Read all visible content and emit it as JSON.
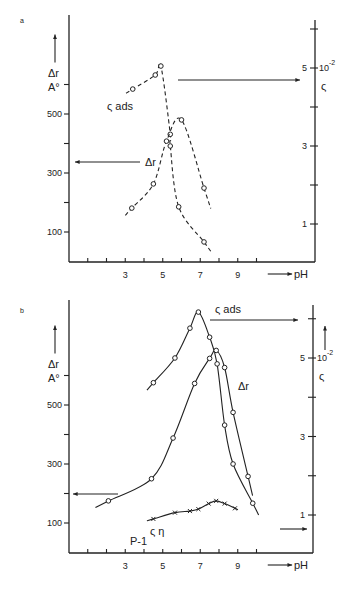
{
  "chart_data": [
    {
      "type": "line",
      "panel_label": "a",
      "xlabel": "pH",
      "ylabel": "Δr A°",
      "ylabel_right": "ς 10⁻²",
      "x_ticks": [
        "3",
        "5",
        "7",
        "9"
      ],
      "y_ticks_left": [
        "100",
        "300",
        "500"
      ],
      "y_ticks_right": [
        "1",
        "3",
        "5"
      ],
      "xlim": [
        0,
        13
      ],
      "ylim_left": [
        0,
        700
      ],
      "ylim_right": [
        0,
        6.5
      ],
      "line_style": "dashed",
      "series": [
        {
          "name": "ς_ads",
          "label": "ς ads",
          "axis": "right",
          "marker": "circle",
          "x": [
            3.4,
            4.6,
            4.9,
            5.4,
            5.4,
            5.85,
            7.2
          ],
          "y": [
            4.46,
            4.82,
            5.05,
            3.3,
            3.0,
            1.44,
            0.54
          ]
        },
        {
          "name": "Δr",
          "label": "Δr",
          "axis": "left",
          "marker": "circle",
          "x": [
            3.35,
            4.5,
            5.2,
            6.0,
            7.2
          ],
          "y": [
            181,
            263,
            408,
            480,
            249
          ]
        }
      ]
    },
    {
      "type": "line",
      "panel_label": "b",
      "xlabel": "pH",
      "ylabel": "Δr A°",
      "ylabel_right": "ς 10⁻²",
      "x_ticks": [
        "3",
        "5",
        "7",
        "9"
      ],
      "y_ticks_left": [
        "100",
        "300",
        "500"
      ],
      "y_ticks_right": [
        "1",
        "3",
        "5"
      ],
      "xlim": [
        0,
        13
      ],
      "ylim_left": [
        0,
        700
      ],
      "ylim_right": [
        0,
        6.5
      ],
      "line_style": "solid",
      "annotation": "P-1",
      "series": [
        {
          "name": "ς_ads",
          "label": "ς ads",
          "axis": "right",
          "marker": "circle",
          "x": [
            4.5,
            5.65,
            6.45,
            6.9,
            7.5,
            7.9,
            8.3,
            8.75,
            9.8
          ],
          "y": [
            4.37,
            5.0,
            5.76,
            6.17,
            5.53,
            4.85,
            3.29,
            2.3,
            1.3
          ]
        },
        {
          "name": "Δr",
          "label": "Δr",
          "axis": "left",
          "marker": "circle",
          "x": [
            2.1,
            4.4,
            5.55,
            6.7,
            7.5,
            7.85,
            8.3,
            8.75,
            9.55
          ],
          "y": [
            175,
            250,
            388,
            573,
            658,
            685,
            627,
            475,
            258
          ]
        },
        {
          "name": "ς_η",
          "label": "ς η",
          "axis": "right",
          "marker": "cross",
          "x": [
            4.5,
            5.65,
            6.45,
            6.9,
            7.45,
            7.85,
            8.3,
            8.85
          ],
          "y": [
            0.9,
            1.06,
            1.1,
            1.15,
            1.29,
            1.36,
            1.29,
            1.17
          ]
        }
      ]
    }
  ]
}
